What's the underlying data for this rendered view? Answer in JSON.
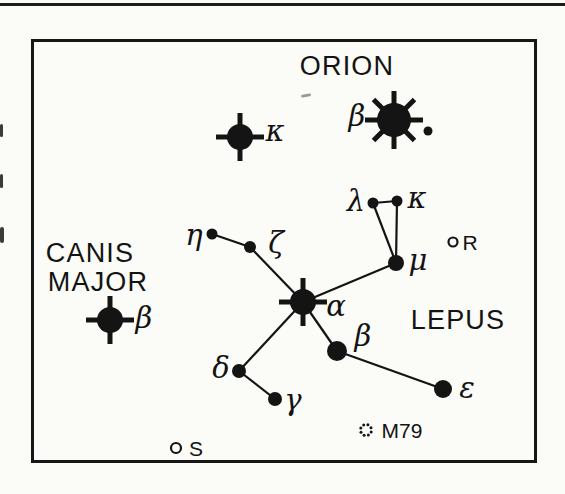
{
  "page": {
    "background": "#fbfbf8",
    "ink": "#141414",
    "top_rule": "full-width horizontal rule above figure"
  },
  "chart": {
    "type": "star-map",
    "frame": {
      "x": 31,
      "y": 39,
      "w": 506,
      "h": 424
    },
    "region_labels": [
      {
        "id": "orion",
        "text": "ORION",
        "x": 347,
        "y": 66
      },
      {
        "id": "canis-line1",
        "text": "CANIS",
        "x": 90,
        "y": 253
      },
      {
        "id": "canis-line2",
        "text": "MAJOR",
        "x": 98,
        "y": 282
      },
      {
        "id": "lepus",
        "text": "LEPUS",
        "x": 458,
        "y": 320
      }
    ],
    "stars": [
      {
        "id": "alpha-lep",
        "label": "α",
        "x": 303,
        "y": 302,
        "r": 13,
        "glyph": "flare4",
        "label_x": 336,
        "label_y": 306
      },
      {
        "id": "beta-lep",
        "label": "β",
        "x": 337,
        "y": 351,
        "r": 10,
        "glyph": "dot",
        "label_x": 363,
        "label_y": 336
      },
      {
        "id": "gamma-lep",
        "label": "γ",
        "x": 275,
        "y": 399,
        "r": 7,
        "glyph": "dot",
        "label_x": 293,
        "label_y": 400
      },
      {
        "id": "delta-lep",
        "label": "δ",
        "x": 239,
        "y": 371,
        "r": 7,
        "glyph": "dot",
        "label_x": 221,
        "label_y": 368
      },
      {
        "id": "epsilon-lep",
        "label": "ε",
        "x": 443,
        "y": 389,
        "r": 9,
        "glyph": "dot",
        "label_x": 467,
        "label_y": 388
      },
      {
        "id": "zeta-lep",
        "label": "ζ",
        "x": 250,
        "y": 247,
        "r": 6,
        "glyph": "dot",
        "label_x": 276,
        "label_y": 243
      },
      {
        "id": "eta-lep",
        "label": "η",
        "x": 212,
        "y": 234,
        "r": 5.5,
        "glyph": "dot",
        "label_x": 194,
        "label_y": 235
      },
      {
        "id": "lambda-lep",
        "label": "λ",
        "x": 373,
        "y": 203,
        "r": 5.5,
        "glyph": "dot",
        "label_x": 356,
        "label_y": 201
      },
      {
        "id": "kappa-lep",
        "label": "κ",
        "x": 397,
        "y": 201,
        "r": 5.5,
        "glyph": "dot",
        "label_x": 417,
        "label_y": 198
      },
      {
        "id": "mu-lep",
        "label": "μ",
        "x": 396,
        "y": 263,
        "r": 8,
        "glyph": "dot",
        "label_x": 418,
        "label_y": 260
      },
      {
        "id": "kappa-ori",
        "label": "κ",
        "x": 240,
        "y": 137,
        "r": 13,
        "glyph": "flare4",
        "label_x": 275,
        "label_y": 131
      },
      {
        "id": "beta-ori",
        "label": "β",
        "x": 394,
        "y": 120,
        "r": 17,
        "glyph": "flare8",
        "label_x": 357,
        "label_y": 116
      },
      {
        "id": "beta-ori-companion",
        "label": "",
        "x": 428,
        "y": 131,
        "r": 4.5,
        "glyph": "dot"
      },
      {
        "id": "beta-cma",
        "label": "β",
        "x": 110,
        "y": 320,
        "r": 13,
        "glyph": "flare4",
        "label_x": 144,
        "label_y": 318
      }
    ],
    "edges": [
      [
        "eta-lep",
        "zeta-lep"
      ],
      [
        "zeta-lep",
        "alpha-lep"
      ],
      [
        "alpha-lep",
        "mu-lep"
      ],
      [
        "mu-lep",
        "lambda-lep"
      ],
      [
        "mu-lep",
        "kappa-lep"
      ],
      [
        "lambda-lep",
        "kappa-lep"
      ],
      [
        "alpha-lep",
        "delta-lep"
      ],
      [
        "alpha-lep",
        "beta-lep"
      ],
      [
        "beta-lep",
        "epsilon-lep"
      ],
      [
        "delta-lep",
        "gamma-lep"
      ]
    ],
    "objects": [
      {
        "id": "r-lep",
        "label": "R",
        "type": "open-circle",
        "x": 453,
        "y": 242,
        "r": 4.5,
        "label_x": 470,
        "label_y": 242
      },
      {
        "id": "s-lep",
        "label": "S",
        "type": "open-circle",
        "x": 176,
        "y": 448,
        "r": 5,
        "label_x": 196,
        "label_y": 448
      },
      {
        "id": "m79",
        "label": "M79",
        "type": "dot-cluster",
        "x": 366,
        "y": 430,
        "ring_r": 5.5,
        "dot_r": 1.5,
        "dot_count": 8,
        "label_x": 402,
        "label_y": 430
      }
    ],
    "style": {
      "edge_width": 2.2,
      "spike_width": 5,
      "flare4_spike_reach": 11,
      "flare8_spike_reach": 12,
      "open_circle_stroke": 2.2
    }
  },
  "artifacts": [
    {
      "x": 0,
      "y": 124,
      "w": 3,
      "h": 13,
      "rotate": 0,
      "color": "#3a3a3a"
    },
    {
      "x": 0,
      "y": 174,
      "w": 3,
      "h": 14,
      "rotate": 0,
      "color": "#3a3a3a"
    },
    {
      "x": 0,
      "y": 227,
      "w": 4,
      "h": 16,
      "rotate": 0,
      "color": "#3a3a3a"
    },
    {
      "x": 301,
      "y": 94,
      "w": 10,
      "h": 3,
      "rotate": -10,
      "color": "#9a9a96"
    }
  ]
}
